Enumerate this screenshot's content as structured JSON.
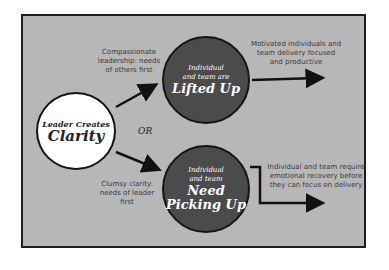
{
  "diagram": {
    "center": {
      "line1": "Leader Creates",
      "line2": "Clarity"
    },
    "or_label": "OR",
    "top_path": {
      "label": [
        "Compassionate",
        "leadership: needs",
        "of others first"
      ],
      "circle": {
        "line1": "Individual",
        "line2": "and team are",
        "line3": "Lifted Up"
      },
      "outcome": [
        "Motivated individuals and",
        "team delivery focused",
        "and productive"
      ]
    },
    "bottom_path": {
      "label": [
        "Clumsy clarity:",
        "needs of leader first"
      ],
      "circle": {
        "line1": "Individual",
        "line2": "and team",
        "line3": "Need",
        "line4": "Picking Up"
      },
      "outcome": [
        "Individual and team require",
        "emotional recovery before",
        "they can focus on delivery"
      ]
    },
    "colors": {
      "background": "#b7b7b7",
      "dark_circle": "#4b4b4b",
      "border": "#1e1e1e"
    }
  }
}
